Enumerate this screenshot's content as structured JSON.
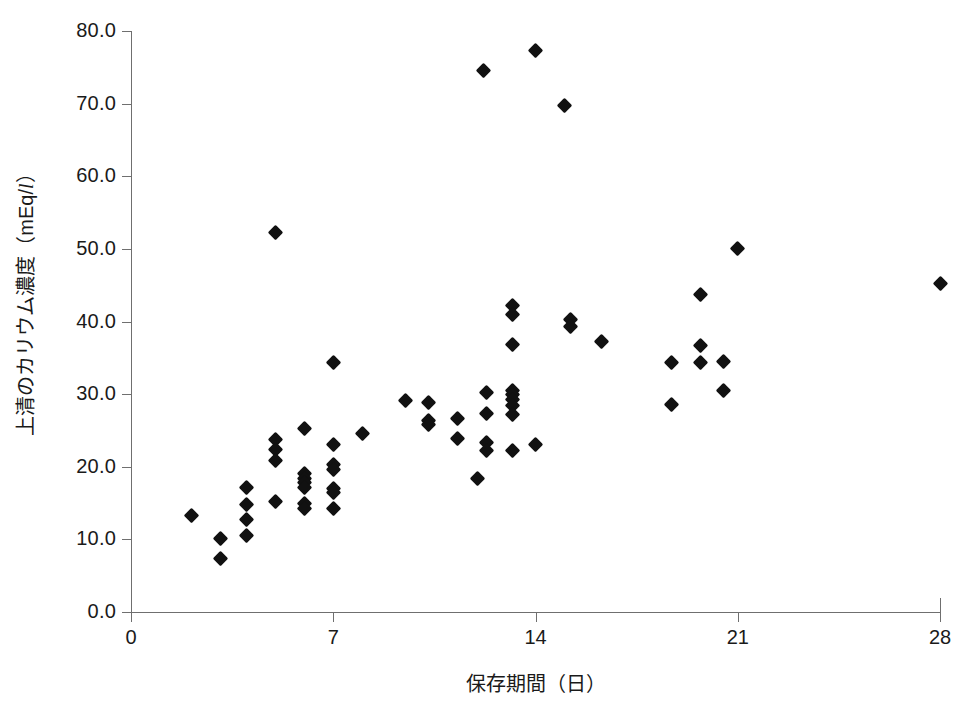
{
  "chart_data": {
    "type": "scatter",
    "title": "",
    "xlabel": "保存期間（日）",
    "ylabel": "上清のカリウム濃度（mEq/l）",
    "ylabel_prefix": "上清のカリウム濃度（mEq/",
    "ylabel_italic": "l",
    "ylabel_suffix": "）",
    "xlim": [
      0,
      28
    ],
    "ylim": [
      0,
      80
    ],
    "xticks": [
      "0",
      "7",
      "14",
      "21",
      "28"
    ],
    "xtick_values": [
      0,
      7,
      14,
      21,
      28
    ],
    "yticks": [
      "0.0",
      "10.0",
      "20.0",
      "30.0",
      "40.0",
      "50.0",
      "60.0",
      "70.0",
      "80.0"
    ],
    "ytick_values": [
      0,
      10,
      20,
      30,
      40,
      50,
      60,
      70,
      80
    ],
    "grid": false,
    "legend": false,
    "marker": "diamond",
    "marker_color": "#111111",
    "axis_color": "#6f6f6f",
    "background": "#ffffff",
    "series": [
      {
        "name": "上清カリウム濃度",
        "points": [
          [
            2.1,
            13.3
          ],
          [
            3.1,
            10.1
          ],
          [
            3.1,
            7.4
          ],
          [
            4.0,
            17.1
          ],
          [
            4.0,
            14.8
          ],
          [
            4.0,
            12.8
          ],
          [
            4.0,
            10.6
          ],
          [
            5.0,
            52.2
          ],
          [
            5.0,
            23.8
          ],
          [
            5.0,
            22.4
          ],
          [
            5.0,
            20.9
          ],
          [
            5.0,
            15.2
          ],
          [
            6.0,
            25.2
          ],
          [
            6.0,
            19.1
          ],
          [
            6.0,
            18.4
          ],
          [
            6.0,
            17.8
          ],
          [
            6.0,
            17.2
          ],
          [
            6.0,
            15.0
          ],
          [
            6.0,
            14.3
          ],
          [
            7.0,
            34.4
          ],
          [
            7.0,
            23.1
          ],
          [
            7.0,
            20.3
          ],
          [
            7.0,
            19.6
          ],
          [
            7.0,
            17.0
          ],
          [
            7.0,
            16.4
          ],
          [
            7.0,
            14.3
          ],
          [
            8.0,
            24.6
          ],
          [
            9.5,
            29.1
          ],
          [
            10.3,
            28.9
          ],
          [
            10.3,
            26.4
          ],
          [
            10.3,
            25.8
          ],
          [
            11.3,
            26.7
          ],
          [
            11.3,
            23.9
          ],
          [
            12.0,
            18.4
          ],
          [
            12.2,
            74.6
          ],
          [
            12.3,
            30.2
          ],
          [
            12.3,
            27.4
          ],
          [
            12.3,
            23.3
          ],
          [
            12.3,
            22.2
          ],
          [
            13.2,
            42.2
          ],
          [
            13.2,
            41.0
          ],
          [
            13.2,
            36.8
          ],
          [
            13.2,
            30.5
          ],
          [
            13.2,
            30.0
          ],
          [
            13.2,
            29.3
          ],
          [
            13.2,
            28.5
          ],
          [
            13.2,
            27.2
          ],
          [
            13.2,
            22.2
          ],
          [
            14.0,
            77.3
          ],
          [
            14.0,
            23.0
          ],
          [
            15.0,
            69.7
          ],
          [
            15.2,
            40.3
          ],
          [
            15.2,
            39.3
          ],
          [
            16.3,
            37.3
          ],
          [
            18.7,
            34.4
          ],
          [
            18.7,
            28.6
          ],
          [
            19.7,
            43.7
          ],
          [
            19.7,
            36.7
          ],
          [
            19.7,
            34.4
          ],
          [
            20.5,
            34.5
          ],
          [
            20.5,
            30.5
          ],
          [
            21.0,
            50.1
          ],
          [
            28.0,
            45.3
          ]
        ]
      }
    ]
  }
}
